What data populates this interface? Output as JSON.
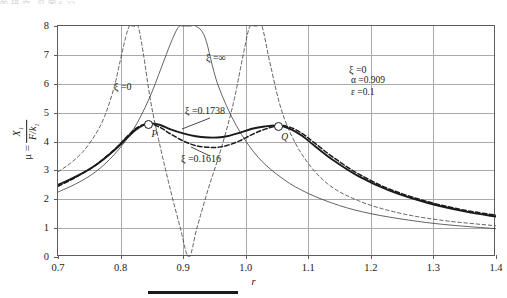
{
  "figure": {
    "artifact_text": "的 研 究 , 见 图 6-23",
    "caption_rule": true
  },
  "axes": {
    "x_label": "r",
    "x_ticks": [
      "0.7",
      "0.8",
      "0.9",
      "1.0",
      "1.1",
      "1.2",
      "1.3",
      "1.4"
    ],
    "y_ticks": [
      "0",
      "1",
      "2",
      "3",
      "4",
      "5",
      "6",
      "7",
      "8"
    ],
    "y_label_prefix": "μ =",
    "y_label_numerator": "X",
    "y_label_numerator_sub": "1",
    "y_label_denominator": "F/k",
    "y_label_denominator_sub": "1"
  },
  "annotations": {
    "zeta_zero_left": "ξ =0",
    "zeta_inf": "ξ =∞",
    "zeta_zero_right": "ξ =0",
    "zeta_opt": "ξ =0.1738",
    "zeta_alt": "ξ =0.1616",
    "point_p": "P",
    "point_q": "Q",
    "param_alpha": "α =0.909",
    "param_epsilon": "ε =0.1"
  },
  "chart_data": {
    "type": "line",
    "title": "",
    "xlabel": "r",
    "ylabel": "μ = X1/(F/k1)",
    "xlim": [
      0.7,
      1.4
    ],
    "ylim": [
      0,
      8
    ],
    "xticks": [
      0.7,
      0.8,
      0.9,
      1.0,
      1.1,
      1.2,
      1.3,
      1.4
    ],
    "yticks": [
      0,
      1,
      2,
      3,
      4,
      5,
      6,
      7,
      8
    ],
    "grid": true,
    "legend_position": "inline-annotations",
    "fixed_points": [
      {
        "name": "P",
        "x": 0.843,
        "y": 4.62
      },
      {
        "name": "Q",
        "x": 1.052,
        "y": 4.55
      }
    ],
    "parameters": {
      "alpha": 0.909,
      "epsilon": 0.1,
      "notch_frequency_ratio": 0.909
    },
    "series": [
      {
        "name": "ξ =0",
        "style": "dashed",
        "width": 0.8,
        "comment": "undamped absorber; two resonance asymptotes and anti-resonance notch at r=0.909",
        "x": [
          0.7,
          0.72,
          0.74,
          0.76,
          0.775,
          0.79,
          0.8,
          0.808,
          0.814,
          0.818,
          0.8225,
          0.8225,
          0.828,
          0.836,
          0.848,
          0.862,
          0.88,
          0.895,
          0.909,
          0.922,
          0.94,
          0.96,
          0.98,
          0.995,
          1.005,
          1.01,
          1.0135,
          1.0135,
          1.018,
          1.026,
          1.04,
          1.06,
          1.09,
          1.13,
          1.18,
          1.24,
          1.31,
          1.4
        ],
        "y": [
          2.95,
          3.25,
          3.65,
          4.25,
          4.9,
          5.9,
          6.85,
          7.6,
          8.0,
          8.0,
          8.0,
          8.0,
          8.0,
          7.1,
          5.4,
          3.95,
          2.3,
          1.05,
          0.0,
          1.0,
          2.35,
          3.7,
          5.3,
          6.9,
          7.9,
          8.0,
          8.0,
          8.0,
          8.0,
          8.0,
          6.6,
          4.9,
          3.55,
          2.55,
          1.95,
          1.55,
          1.28,
          1.08
        ]
      },
      {
        "name": "ξ =∞",
        "style": "solid-thin",
        "width": 0.8,
        "comment": "infinitely damped absorber; single resonance near r=0.955 (masses locked)",
        "x": [
          0.7,
          0.73,
          0.76,
          0.79,
          0.82,
          0.845,
          0.865,
          0.88,
          0.892,
          0.9,
          0.906,
          0.909,
          0.909,
          0.912,
          0.92,
          0.935,
          0.955,
          0.985,
          1.02,
          1.06,
          1.1,
          1.15,
          1.2,
          1.26,
          1.32,
          1.4
        ],
        "y": [
          2.25,
          2.55,
          2.95,
          3.55,
          4.4,
          5.45,
          6.55,
          7.4,
          7.95,
          8.0,
          8.0,
          8.0,
          8.0,
          8.0,
          8.0,
          7.6,
          6.0,
          4.55,
          3.45,
          2.7,
          2.2,
          1.78,
          1.5,
          1.28,
          1.12,
          0.98
        ]
      },
      {
        "name": "ξ =0.1738",
        "style": "solid-thick",
        "width": 1.9,
        "comment": "optimum damping - equal peaks through P and Q",
        "x": [
          0.7,
          0.73,
          0.76,
          0.79,
          0.81,
          0.825,
          0.843,
          0.862,
          0.88,
          0.9,
          0.92,
          0.94,
          0.955,
          0.97,
          0.99,
          1.01,
          1.03,
          1.052,
          1.07,
          1.09,
          1.11,
          1.14,
          1.18,
          1.23,
          1.29,
          1.35,
          1.4
        ],
        "y": [
          2.5,
          2.8,
          3.18,
          3.7,
          4.12,
          4.42,
          4.62,
          4.58,
          4.42,
          4.28,
          4.18,
          4.14,
          4.14,
          4.18,
          4.3,
          4.44,
          4.52,
          4.55,
          4.45,
          4.2,
          3.85,
          3.35,
          2.8,
          2.3,
          1.88,
          1.58,
          1.4
        ]
      },
      {
        "name": "ξ =0.1616",
        "style": "dashed-thick",
        "width": 1.5,
        "comment": "slightly under-optimum damping - dips lower between P and Q",
        "x": [
          0.7,
          0.73,
          0.76,
          0.79,
          0.81,
          0.825,
          0.843,
          0.862,
          0.88,
          0.9,
          0.92,
          0.94,
          0.955,
          0.97,
          0.99,
          1.01,
          1.03,
          1.052,
          1.07,
          1.09,
          1.11,
          1.14,
          1.18,
          1.23,
          1.29,
          1.35,
          1.4
        ],
        "y": [
          2.45,
          2.78,
          3.18,
          3.72,
          4.16,
          4.46,
          4.62,
          4.5,
          4.26,
          4.02,
          3.86,
          3.8,
          3.8,
          3.86,
          4.02,
          4.24,
          4.42,
          4.55,
          4.5,
          4.28,
          3.95,
          3.45,
          2.88,
          2.35,
          1.92,
          1.62,
          1.45
        ]
      }
    ]
  }
}
